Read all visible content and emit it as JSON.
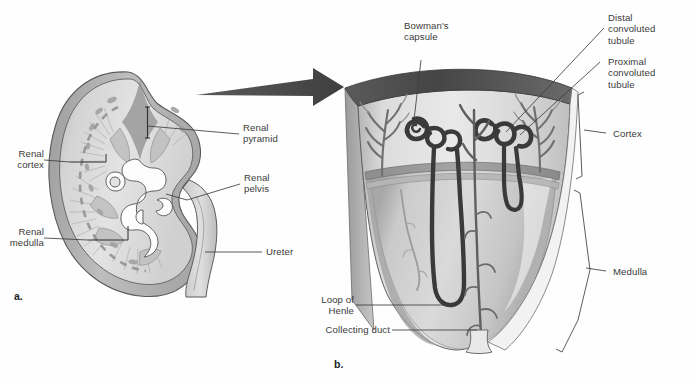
{
  "figure": {
    "background_color": "#fefefe"
  },
  "palette": {
    "capsule_dark": "#4a4a4a",
    "cortex_light": "#e6e6e6",
    "medulla_mid": "#cfcfcf",
    "medulla_shadow": "#a9a9a9",
    "outline": "#555555",
    "tubule_dark": "#3a3a3a",
    "vessel_gray": "#8f8f8f",
    "arrow_gray": "#4d4d4d",
    "label_text": "#3b3b3b",
    "leader_line": "#4a4a4a"
  },
  "panels": [
    {
      "id": "a",
      "letter": "a.",
      "caption": "Kidney coronal section"
    },
    {
      "id": "b",
      "letter": "b.",
      "caption": "Nephron within cortex and medulla"
    }
  ],
  "labels_panel_a": [
    {
      "name": "renal-pyramid",
      "text": "Renal\npyramid"
    },
    {
      "name": "renal-cortex",
      "text": "Renal\ncortex"
    },
    {
      "name": "renal-pelvis",
      "text": "Renal\npelvis"
    },
    {
      "name": "renal-medulla",
      "text": "Renal\nmedulla"
    },
    {
      "name": "ureter",
      "text": "Ureter"
    }
  ],
  "labels_panel_b": [
    {
      "name": "bowmans-capsule",
      "text": "Bowman's\ncapsule"
    },
    {
      "name": "distal-convoluted-tubule",
      "text": "Distal\nconvoluted\ntubule"
    },
    {
      "name": "proximal-convoluted-tubule",
      "text": "Proximal\nconvoluted\ntubule"
    },
    {
      "name": "cortex",
      "text": "Cortex"
    },
    {
      "name": "medulla",
      "text": "Medulla"
    },
    {
      "name": "loop-of-henle",
      "text": "Loop of\nHenle"
    },
    {
      "name": "collecting-duct",
      "text": "Collecting duct"
    }
  ]
}
